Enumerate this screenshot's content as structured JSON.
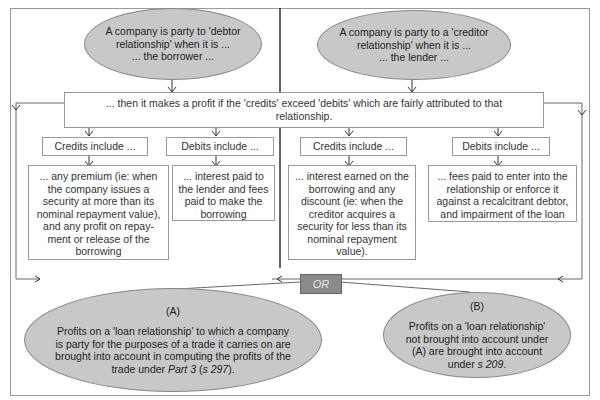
{
  "debtor": {
    "oval_line1": "A company is party to 'debtor",
    "oval_line2": "relationship' when it is ...",
    "oval_line3": "... the borrower ...",
    "credits_header": "Credits include ...",
    "credits_body": "... any premium (ie: when the company issues a security at more than its nominal repayment value), and any profit on repay-ment or release of the borrowing",
    "debits_header": "Debits include ...",
    "debits_body": "... interest paid to the lender and fees paid to make the borrowing"
  },
  "creditor": {
    "oval_line1": "A company is party to a 'creditor",
    "oval_line2": "relationship' when it is ...",
    "oval_line3": "... the lender ...",
    "credits_header": "Credits include ...",
    "credits_body": "... interest earned on the borrowing and any discount (ie: when the creditor acquires a security for less than its nominal repayment value).",
    "debits_header": "Debits include ...",
    "debits_body": "... fees paid to enter into the relationship or enforce it against a recalcitrant debtor, and impairment of the loan"
  },
  "profit_box": {
    "line1": "...  then it makes a profit if the 'credits' exceed 'debits' which are fairly attributed to that",
    "line2": "relationship."
  },
  "or_label": "OR",
  "option_a": {
    "label": "(A)",
    "text_before": "Profits on a 'loan relationship' to which a company is party for the purposes of a trade it carries on are brought into account in computing the profits  of the trade under ",
    "part": "Part 3",
    "paren_open": " (",
    "section": "s 297",
    "paren_close": ")."
  },
  "option_b": {
    "label": "(B)",
    "text_before": "Profits on a 'loan relationship' not brought into account under (A) are brought into account under ",
    "section": "s 209",
    "text_after": "."
  },
  "colors": {
    "oval_fill": "#c8c8c8",
    "or_fill": "#8a8a8a",
    "border": "#999999"
  }
}
